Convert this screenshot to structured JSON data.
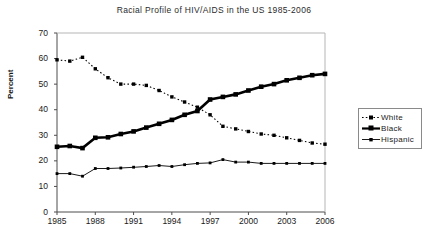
{
  "chart_data": {
    "type": "line",
    "title": "Racial Profile of HIV/AIDS in the US 1985-2006",
    "xlabel": "",
    "ylabel": "Percent",
    "ylim": [
      0,
      70
    ],
    "ytick_values": [
      0,
      10,
      20,
      30,
      40,
      50,
      60,
      70
    ],
    "xlim": [
      1985,
      2006
    ],
    "xtick_labels": [
      "1985",
      "1988",
      "1991",
      "1994",
      "1997",
      "2000",
      "2003",
      "2006"
    ],
    "xtick_values": [
      1985,
      1988,
      1991,
      1994,
      1997,
      2000,
      2003,
      2006
    ],
    "grid": false,
    "legend_position": "right",
    "x": [
      1985,
      1986,
      1987,
      1988,
      1989,
      1990,
      1991,
      1992,
      1993,
      1994,
      1995,
      1996,
      1997,
      1998,
      1999,
      2000,
      2001,
      2002,
      2003,
      2004,
      2005,
      2006
    ],
    "series": [
      {
        "name": "White",
        "style": "dotted",
        "marker": "square",
        "color": "#000000",
        "values": [
          59.5,
          59.0,
          60.5,
          56.0,
          52.5,
          50.0,
          50.0,
          49.5,
          47.5,
          45.0,
          43.0,
          41.0,
          38.0,
          33.5,
          32.5,
          31.5,
          30.5,
          30.0,
          29.0,
          28.0,
          27.0,
          26.5
        ]
      },
      {
        "name": "Black",
        "style": "solid-bold",
        "marker": "square",
        "color": "#000000",
        "values": [
          25.5,
          25.8,
          25.0,
          29.0,
          29.2,
          30.5,
          31.5,
          33.0,
          34.5,
          36.0,
          38.0,
          39.5,
          44.0,
          45.0,
          46.0,
          47.5,
          49.0,
          50.0,
          51.5,
          52.5,
          53.5,
          54.0
        ]
      },
      {
        "name": "Hispanic",
        "style": "solid-thin",
        "marker": "square",
        "color": "#000000",
        "values": [
          15.0,
          15.0,
          14.0,
          17.0,
          17.0,
          17.2,
          17.5,
          17.8,
          18.2,
          17.8,
          18.5,
          19.0,
          19.2,
          20.5,
          19.5,
          19.5,
          19.0,
          19.0,
          19.0,
          19.0,
          19.0,
          19.0
        ]
      }
    ]
  },
  "legend": {
    "entries": [
      {
        "label": "White"
      },
      {
        "label": "Black"
      },
      {
        "label": "Hispanic"
      }
    ]
  }
}
